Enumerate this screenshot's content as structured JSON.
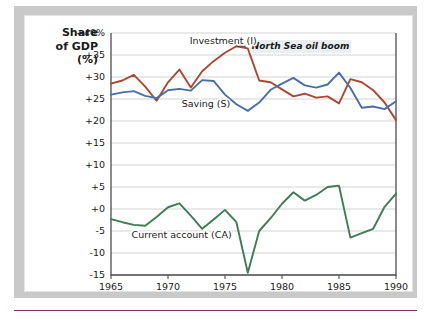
{
  "figure": {
    "y_axis_title_lines": [
      "Share",
      "of GDP",
      "(%)"
    ],
    "frame_color": "#c9c9c9",
    "rule_color": "#7d3a4c"
  },
  "chart_data": {
    "type": "line",
    "title": "",
    "xlabel": "",
    "ylabel": "Share of GDP (%)",
    "grid": true,
    "legend": "inline-labels",
    "xlim": [
      1965,
      1990
    ],
    "ylim": [
      -15,
      40
    ],
    "x_ticks": [
      1965,
      1970,
      1975,
      1980,
      1985,
      1990
    ],
    "x_tick_labels": [
      "1965",
      "1970",
      "1975",
      "1980",
      "1985",
      "1990"
    ],
    "y_ticks": [
      40,
      35,
      30,
      25,
      20,
      15,
      10,
      5,
      0,
      -5,
      -10,
      -15
    ],
    "y_tick_labels": [
      "+40%",
      "+35",
      "+30",
      "+25",
      "+20",
      "+15",
      "+10",
      "+5",
      "+0",
      "-5",
      "-10",
      "-15"
    ],
    "x": [
      1965,
      1966,
      1967,
      1968,
      1969,
      1970,
      1971,
      1972,
      1973,
      1974,
      1975,
      1976,
      1977,
      1978,
      1979,
      1980,
      1981,
      1982,
      1983,
      1984,
      1985,
      1986,
      1987,
      1988,
      1989,
      1990
    ],
    "series": [
      {
        "name": "Investment (I)",
        "short": "I",
        "color": "#a8492f",
        "label": "Investment (I)",
        "values": [
          28.5,
          29.2,
          30.5,
          27.8,
          24.6,
          28.8,
          31.7,
          27.6,
          31.3,
          33.6,
          35.5,
          37.0,
          36.5,
          29.2,
          28.8,
          27.2,
          25.6,
          26.2,
          25.3,
          25.6,
          24.0,
          29.5,
          28.8,
          27.0,
          24.2,
          20.2
        ]
      },
      {
        "name": "Saving (S)",
        "short": "S",
        "color": "#4a6fa5",
        "label": "Saving (S)",
        "values": [
          26.0,
          26.5,
          26.8,
          25.7,
          25.2,
          27.0,
          27.3,
          26.9,
          29.3,
          29.1,
          26.0,
          23.8,
          22.3,
          24.2,
          27.1,
          28.5,
          29.8,
          28.1,
          27.6,
          28.3,
          31.0,
          27.5,
          23.0,
          23.3,
          22.7,
          24.5
        ]
      },
      {
        "name": "Current account (CA)",
        "short": "CA",
        "color": "#3e7c53",
        "label": "Current account (CA)",
        "values": [
          -2.3,
          -3.0,
          -3.6,
          -3.8,
          -1.8,
          0.4,
          1.3,
          -1.5,
          -4.5,
          -2.4,
          -0.2,
          -3.0,
          -14.5,
          -5.0,
          -2.1,
          1.2,
          3.8,
          1.9,
          3.2,
          5.0,
          5.3,
          -6.5,
          -5.5,
          -4.5,
          0.5,
          3.5
        ]
      }
    ],
    "annotations": [
      {
        "text": "North Sea oil boom",
        "x": 1977.0,
        "y": 37.0,
        "leader_from_x": 1975.9,
        "leader_to_x": 1977.0,
        "leader_y": 37.0
      }
    ],
    "series_label_positions": [
      {
        "label_for": "Investment (I)",
        "x": 1971.9,
        "y": 37.6
      },
      {
        "label_for": "Saving (S)",
        "x": 1971.2,
        "y": 23.2
      },
      {
        "label_for": "Current account (CA)",
        "x": 1966.8,
        "y": -6.6
      }
    ]
  }
}
